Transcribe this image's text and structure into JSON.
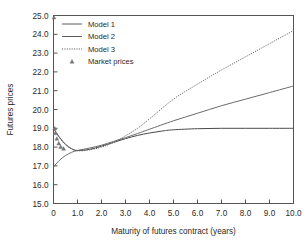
{
  "chart_data": {
    "type": "line",
    "title": "",
    "xlabel": "Maturity of futures contract (years)",
    "ylabel": "Futures prices",
    "xlim": [
      0,
      10
    ],
    "ylim": [
      15.0,
      25.0
    ],
    "grid": false,
    "legend_position": "top-left",
    "xticks": [
      "0",
      "1.0",
      "2.0",
      "3.0",
      "4.0",
      "5.0",
      "6.0",
      "7.0",
      "8.0",
      "9.0",
      "10.0"
    ],
    "xtick_values": [
      0,
      1,
      2,
      3,
      4,
      5,
      6,
      7,
      8,
      9,
      10
    ],
    "yticks": [
      "15.0",
      "16.0",
      "17.0",
      "18.0",
      "19.0",
      "20.0",
      "21.0",
      "22.0",
      "23.0",
      "24.0",
      "25.0"
    ],
    "ytick_values": [
      15.0,
      16.0,
      17.0,
      18.0,
      19.0,
      20.0,
      21.0,
      22.0,
      23.0,
      24.0,
      25.0
    ],
    "series": [
      {
        "name": "Model 1",
        "style": "solid",
        "color": "#4a4a4a",
        "x": [
          0,
          0.25,
          0.5,
          0.75,
          1.0,
          1.5,
          2.0,
          2.5,
          3.0,
          3.5,
          4.0,
          4.5,
          5.0,
          6.0,
          7.0,
          8.0,
          9.0,
          10.0
        ],
        "y": [
          19.0,
          18.52,
          18.15,
          17.92,
          17.82,
          17.88,
          18.05,
          18.25,
          18.45,
          18.62,
          18.75,
          18.85,
          18.92,
          18.98,
          19.0,
          19.0,
          19.0,
          19.0
        ]
      },
      {
        "name": "Model 2",
        "style": "solid",
        "color": "#6a6a6a",
        "x": [
          0,
          0.25,
          0.5,
          0.75,
          1.0,
          1.5,
          2.0,
          2.5,
          3.0,
          3.5,
          4.0,
          5.0,
          6.0,
          7.0,
          8.0,
          9.0,
          10.0
        ],
        "y": [
          16.95,
          17.3,
          17.55,
          17.72,
          17.82,
          17.95,
          18.1,
          18.3,
          18.5,
          18.72,
          18.95,
          19.4,
          19.8,
          20.2,
          20.55,
          20.9,
          21.25
        ]
      },
      {
        "name": "Model 3",
        "style": "dotted",
        "color": "#5a5a5a",
        "x": [
          0,
          0.25,
          0.5,
          0.75,
          1.0,
          1.5,
          2.0,
          2.5,
          3.0,
          3.5,
          4.0,
          5.0,
          6.0,
          7.0,
          8.0,
          9.0,
          10.0
        ],
        "y": [
          19.0,
          18.5,
          18.12,
          17.9,
          17.8,
          17.85,
          18.0,
          18.25,
          18.6,
          19.0,
          19.5,
          20.55,
          21.35,
          22.1,
          22.8,
          23.5,
          24.2
        ]
      },
      {
        "name": "Market prices",
        "style": "marker",
        "marker": "triangle",
        "color": "#777777",
        "x": [
          0.02,
          0.05,
          0.08,
          0.14,
          0.22,
          0.3,
          0.42
        ],
        "y": [
          24.9,
          19.0,
          18.75,
          18.45,
          18.2,
          18.02,
          17.92
        ]
      }
    ]
  },
  "legend": {
    "items": [
      {
        "label": "Model 1",
        "style": "solid"
      },
      {
        "label": "Model 2",
        "style": "solid"
      },
      {
        "label": "Model 3",
        "style": "dotted"
      },
      {
        "label": "Market prices",
        "style": "marker"
      }
    ]
  },
  "axes": {
    "x_title": "Maturity of futures contract (years)",
    "y_title": "Futures prices"
  }
}
